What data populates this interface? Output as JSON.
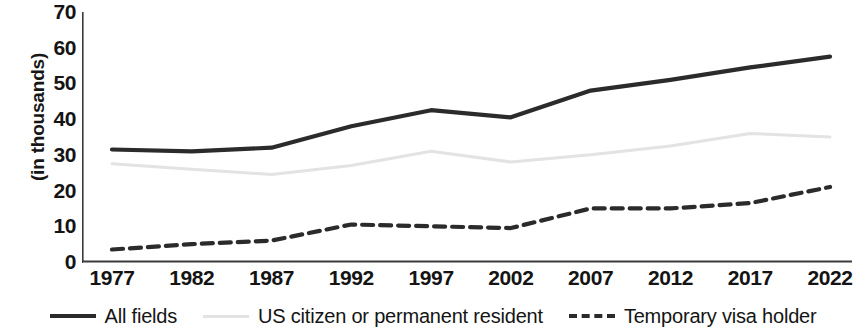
{
  "chart_data": {
    "type": "line",
    "title": "",
    "subtitle": "",
    "xlabel": "",
    "ylabel": "(in thousands)",
    "categories": [
      "1977",
      "1982",
      "1987",
      "1992",
      "1997",
      "2002",
      "2007",
      "2012",
      "2017",
      "2022"
    ],
    "x": [
      1977,
      1982,
      1987,
      1992,
      1997,
      2002,
      2007,
      2012,
      2017,
      2022
    ],
    "xlim": [
      1977,
      2022
    ],
    "ylim": [
      0,
      70
    ],
    "ytick_labels": [
      "0",
      "10",
      "20",
      "30",
      "40",
      "50",
      "60",
      "70"
    ],
    "ytick_values": [
      0,
      10,
      20,
      30,
      40,
      50,
      60,
      70
    ],
    "grid": false,
    "legend_position": "bottom",
    "series": [
      {
        "name": "All fields",
        "style": "solid",
        "color": "#2b2b2b",
        "values": [
          31.5,
          31.0,
          32.0,
          38.0,
          42.5,
          40.5,
          48.0,
          51.0,
          54.5,
          57.5
        ]
      },
      {
        "name": "US citizen or permanent resident",
        "style": "solid-light",
        "color": "#e3e3e3",
        "values": [
          27.5,
          26.0,
          24.5,
          27.0,
          31.0,
          28.0,
          30.0,
          32.5,
          36.0,
          35.0
        ]
      },
      {
        "name": "Temporary visa holder",
        "style": "dashed",
        "color": "#2b2b2b",
        "values": [
          3.5,
          5.0,
          6.0,
          10.5,
          10.0,
          9.5,
          15.0,
          15.0,
          16.5,
          21.0
        ]
      }
    ]
  },
  "axis": {
    "y_title": "(in thousands)",
    "axis_color": "#3a3a3a"
  },
  "legend": {
    "items": [
      {
        "label": "All fields",
        "swatch": "line-solid-dark-icon"
      },
      {
        "label": "US citizen or permanent resident",
        "swatch": "line-solid-light-icon"
      },
      {
        "label": "Temporary visa holder",
        "swatch": "line-dashed-icon"
      }
    ]
  }
}
